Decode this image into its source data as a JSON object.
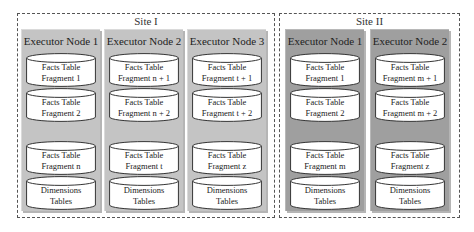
{
  "diagram": {
    "sites": [
      {
        "label": "Site I",
        "nodes": [
          {
            "title": "Executor Node 1",
            "cylinders": [
              {
                "line1": "Facts Table",
                "line2": "Fragment 1"
              },
              {
                "line1": "Facts Table",
                "line2": "Fragment 2"
              },
              {
                "line1": "Facts Table",
                "line2": "Fragment n"
              },
              {
                "line1": "Dimensions",
                "line2": "Tables"
              }
            ]
          },
          {
            "title": "Executor Node 2",
            "cylinders": [
              {
                "line1": "Facts Table",
                "line2": "Fragment n + 1"
              },
              {
                "line1": "Facts Table",
                "line2": "Fragment n + 2"
              },
              {
                "line1": "Facts Table",
                "line2": "Fragment t"
              },
              {
                "line1": "Dimensions",
                "line2": "Tables"
              }
            ]
          },
          {
            "title": "Executor Node 3",
            "cylinders": [
              {
                "line1": "Facts Table",
                "line2": "Fragment t + 1"
              },
              {
                "line1": "Facts Table",
                "line2": "Fragment t + 2"
              },
              {
                "line1": "Facts Table",
                "line2": "Fragment z"
              },
              {
                "line1": "Dimensions",
                "line2": "Tables"
              }
            ]
          }
        ]
      },
      {
        "label": "Site II",
        "nodes": [
          {
            "title": "Executor Node 1",
            "cylinders": [
              {
                "line1": "Facts Table",
                "line2": "Fragment 1"
              },
              {
                "line1": "Facts Table",
                "line2": "Fragment 2"
              },
              {
                "line1": "Facts Table",
                "line2": "Fragment m"
              },
              {
                "line1": "Dimensions",
                "line2": "Tables"
              }
            ]
          },
          {
            "title": "Executor Node 2",
            "cylinders": [
              {
                "line1": "Facts Table",
                "line2": "Fragment m + 1"
              },
              {
                "line1": "Facts Table",
                "line2": "Fragment m + 2"
              },
              {
                "line1": "Facts Table",
                "line2": "Fragment z"
              },
              {
                "line1": "Dimensions",
                "line2": "Tables"
              }
            ]
          }
        ]
      }
    ],
    "colors": {
      "site1_node": "#c4c4c4",
      "site2_node": "#9f9f9f",
      "cylinder_fill": "#ffffff",
      "border": "#555555"
    }
  }
}
